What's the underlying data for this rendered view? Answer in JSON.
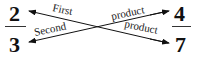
{
  "diagram": {
    "left_fraction": {
      "numerator": "2",
      "denominator": "3"
    },
    "right_fraction": {
      "numerator": "4",
      "denominator": "7"
    },
    "arrows": [
      {
        "from": "7",
        "to": "2",
        "label_left": "First",
        "label_right": "product"
      },
      {
        "from": "4",
        "to": "3",
        "label_left": "Second",
        "label_right": "product"
      }
    ],
    "labels": {
      "first": "First",
      "second": "Second",
      "product_top": "product",
      "product_bottom": "product"
    },
    "colors": {
      "ink": "#111111",
      "background": "#ffffff"
    }
  }
}
